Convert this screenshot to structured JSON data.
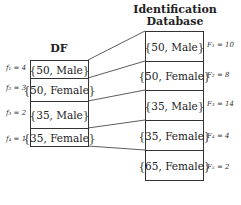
{
  "df": {
    "title": "DF",
    "rows": [
      {
        "value": "{50, Male}",
        "label": "f₁ = 4"
      },
      {
        "value": "{50, Female}",
        "label": "f₂ = 3"
      },
      {
        "value": "{35, Male}",
        "label": "f₃ = 2"
      },
      {
        "value": "{35, Female}",
        "label": "f₄ = 1"
      }
    ]
  },
  "database": {
    "title_line1": "Identification",
    "title_line2": "Database",
    "rows": [
      {
        "value": "{50, Male}",
        "label": "F₁ = 10"
      },
      {
        "value": "{50, Female}",
        "label": "F₂ = 8"
      },
      {
        "value": "{35, Male}",
        "label": "F₃ = 14"
      },
      {
        "value": "{35, Female}",
        "label": "F₄ = 4"
      },
      {
        "value": "{65, Female}",
        "label": "F₅ = 2"
      }
    ]
  }
}
